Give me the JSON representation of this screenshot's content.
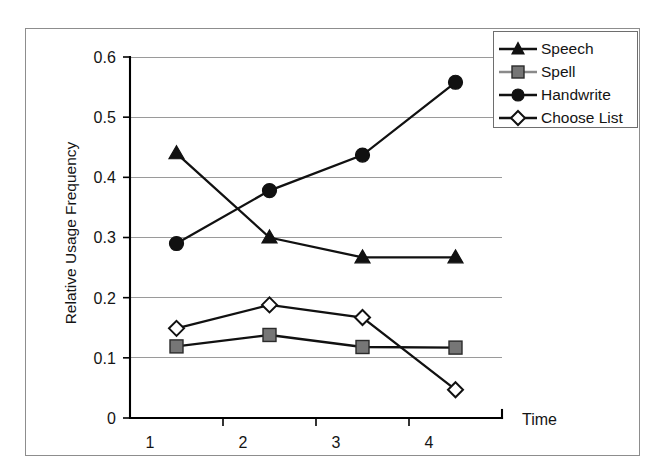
{
  "chart_data": {
    "type": "line",
    "title": "",
    "xlabel": "Time",
    "ylabel": "Relative Usage Frequency",
    "categories": [
      "1",
      "2",
      "3",
      "4"
    ],
    "x": [
      1,
      2,
      3,
      4
    ],
    "xlim": [
      0.5,
      4.5
    ],
    "ylim": [
      0,
      0.6
    ],
    "yticks": [
      0,
      0.1,
      0.2,
      0.3,
      0.4,
      0.5,
      0.6
    ],
    "ytick_labels": [
      "0",
      "0.1",
      "0.2",
      "0.3",
      "0.4",
      "0.5",
      "0.6"
    ],
    "xtick_labels": [
      "1",
      "2",
      "3",
      "4"
    ],
    "grid": "horizontal",
    "legend_position": "top-right",
    "series": [
      {
        "name": "Speech",
        "marker": "filled-triangle",
        "color": "#111111",
        "values": [
          0.44,
          0.3,
          0.267,
          0.267
        ]
      },
      {
        "name": "Spell",
        "marker": "filled-square",
        "color": "#767676",
        "values": [
          0.119,
          0.138,
          0.118,
          0.117
        ]
      },
      {
        "name": "Handwrite",
        "marker": "filled-circle",
        "color": "#111111",
        "values": [
          0.29,
          0.378,
          0.437,
          0.558
        ]
      },
      {
        "name": "Choose List",
        "marker": "open-diamond",
        "color": "#111111",
        "values": [
          0.149,
          0.188,
          0.167,
          0.047
        ]
      }
    ]
  },
  "axes": {
    "y_title": "Relative Usage Frequency",
    "x_title": "Time",
    "y_labels": [
      "0.6",
      "0.5",
      "0.4",
      "0.3",
      "0.2",
      "0.1",
      "0"
    ],
    "x_labels": [
      "1",
      "2",
      "3",
      "4"
    ]
  },
  "legend": {
    "items": [
      {
        "label": "Speech",
        "marker": "filled-triangle",
        "color": "#111111"
      },
      {
        "label": "Spell",
        "marker": "filled-square",
        "color": "#767676"
      },
      {
        "label": "Handwrite",
        "marker": "filled-circle",
        "color": "#111111"
      },
      {
        "label": "Choose List",
        "marker": "open-diamond",
        "color": "#111111"
      }
    ]
  }
}
